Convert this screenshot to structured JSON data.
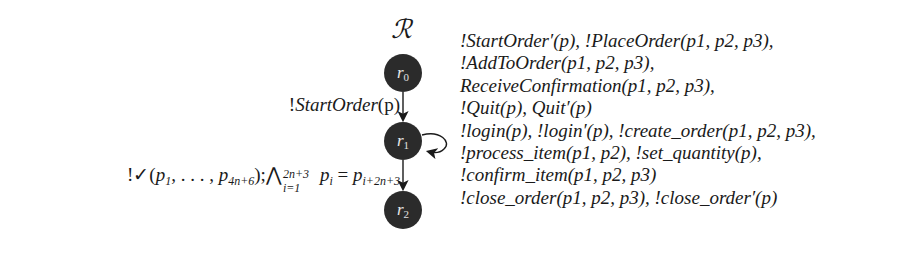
{
  "diagram": {
    "title": "ℛ",
    "nodes": [
      {
        "id": "r0",
        "base": "r",
        "sub": "0"
      },
      {
        "id": "r1",
        "base": "r",
        "sub": "1"
      },
      {
        "id": "r2",
        "base": "r",
        "sub": "2"
      }
    ],
    "edges": [
      {
        "from": "r0",
        "to": "r1",
        "label": "!StartOrder(p)"
      },
      {
        "from": "r1",
        "to": "r1",
        "label": "self-loop (see loop label)"
      },
      {
        "from": "r1",
        "to": "r2",
        "label": "!✓(p1, …, p4n+6); ⋀_{i=1}^{2n+3} p_i = p_{i+2n+3}"
      }
    ],
    "edge_r0_r1": {
      "prefix": "!",
      "name": "StartOrder",
      "args": "(p)"
    },
    "edge_r1_r2": {
      "prefix": "!✓",
      "open": "(",
      "p": "p",
      "sub1": "1",
      "dots": ", . . . , ",
      "sub_last": "4n+6",
      "close": ");",
      "bigwedge": "⋀",
      "wedge_sup": "2n+3",
      "wedge_sub": "i=1",
      "sub_i": "i",
      "eq": " = ",
      "sub_rhs": "i+2n+3"
    },
    "loop_label_lines": [
      "!StartOrder′(p), !PlaceOrder(p1, p2, p3),",
      "!AddToOrder(p1, p2, p3),",
      "ReceiveConfirmation(p1, p2, p3),",
      "!Quit(p), Quit′(p)",
      "!login(p), !login′(p), !create_order(p1, p2, p3),",
      "!process_item(p1, p2), !set_quantity(p),",
      "!confirm_item(p1, p2, p3)",
      "!close_order(p1, p2, p3), !close_order′(p)"
    ],
    "colors": {
      "node_fill": "#2b2b2b",
      "node_text": "#e8e8e8",
      "edge": "#1a1a1a",
      "text": "#1a1a1a",
      "background": "#ffffff"
    }
  }
}
